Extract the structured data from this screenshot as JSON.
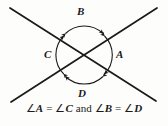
{
  "figure": {
    "type": "geometry-diagram",
    "background_color": "#fdfdfc",
    "stroke_color": "#1a1a1a",
    "labels": {
      "top": "B",
      "left": "C",
      "right": "A",
      "bottom": "D"
    },
    "arcs": [
      {
        "name": "arc-top",
        "label": "B",
        "position": "top",
        "arrowheads": "both"
      },
      {
        "name": "arc-left",
        "label": "C",
        "position": "left",
        "arrowheads": "both"
      },
      {
        "name": "arc-right",
        "label": "A",
        "position": "right",
        "arrowheads": "both"
      },
      {
        "name": "arc-bottom",
        "label": "D",
        "position": "bottom",
        "arrowheads": "both"
      }
    ],
    "lines": [
      {
        "name": "line-nw-se",
        "from": [
          10,
          8
        ],
        "to": [
          156,
          101
        ]
      },
      {
        "name": "line-ne-sw",
        "from": [
          157,
          8
        ],
        "to": [
          11,
          102
        ]
      }
    ],
    "intersection": [
      84,
      55
    ]
  },
  "caption": {
    "full_text": "∠A = ∠C and ∠B = ∠D",
    "angle_symbol": "∠",
    "equals_symbol": "=",
    "conjunction": "and",
    "first_equality": {
      "left": "A",
      "right": "C"
    },
    "second_equality": {
      "left": "B",
      "right": "D"
    }
  }
}
